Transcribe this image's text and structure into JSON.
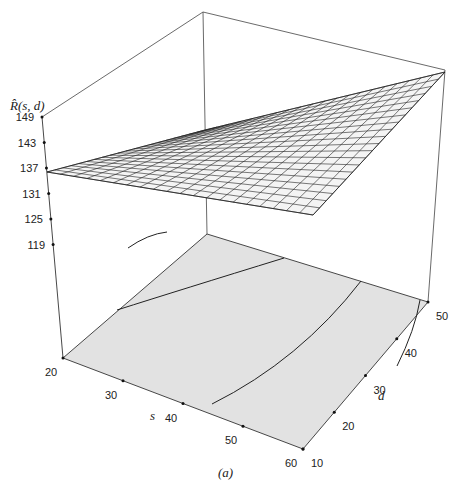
{
  "chart_data": {
    "type": "surface3d",
    "title": "",
    "caption": "(a)",
    "zlabel": "R̂(s, d)",
    "xlabel": "s",
    "ylabel": "d",
    "x_ticks": [
      20,
      30,
      40,
      50,
      60
    ],
    "y_ticks": [
      10,
      20,
      30,
      40,
      50
    ],
    "z_ticks": [
      119,
      125,
      131,
      137,
      143,
      149
    ],
    "x_range": [
      20,
      60
    ],
    "y_range": [
      10,
      50
    ],
    "z_range": [
      113,
      149
    ],
    "surface_corners": [
      {
        "s": 20,
        "d": 10,
        "R": 137
      },
      {
        "s": 60,
        "d": 10,
        "R": 128
      },
      {
        "s": 60,
        "d": 50,
        "R": 148
      },
      {
        "s": 20,
        "d": 50,
        "R": 140
      }
    ],
    "mesh_resolution": 20,
    "base_fill": "#e2e2e2",
    "surface_fill": "#f4f4f4",
    "contours_on_base": true,
    "grid": false,
    "legend": "none"
  },
  "labels": {
    "zlabel": "R̂(s, d)",
    "xlabel": "s",
    "ylabel": "d",
    "caption": "(a)",
    "z_ticks": [
      "149",
      "143",
      "137",
      "131",
      "125",
      "119"
    ],
    "x_ticks": [
      "20",
      "30",
      "40",
      "50",
      "60"
    ],
    "y_ticks": [
      "10",
      "20",
      "30",
      "40",
      "50"
    ]
  }
}
